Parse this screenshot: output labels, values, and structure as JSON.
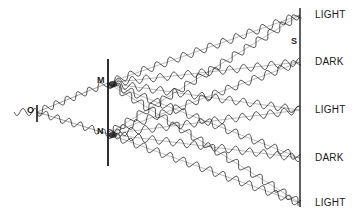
{
  "diagram": {
    "source": {
      "label": "O",
      "x": 37,
      "y": 112
    },
    "slits": [
      {
        "label": "M",
        "x": 108,
        "y": 83
      },
      {
        "label": "N",
        "x": 108,
        "y": 134
      }
    ],
    "screen": {
      "label": "S",
      "x": 300,
      "y_top": 8,
      "y_bottom": 207
    },
    "fringes": [
      {
        "label": "LIGHT",
        "y": 15
      },
      {
        "label": "DARK",
        "y": 62
      },
      {
        "label": "LIGHT",
        "y": 110
      },
      {
        "label": "DARK",
        "y": 158
      },
      {
        "label": "LIGHT",
        "y": 203
      }
    ],
    "colors": {
      "ink": "#1a1a1a",
      "background": "#ffffff"
    }
  }
}
